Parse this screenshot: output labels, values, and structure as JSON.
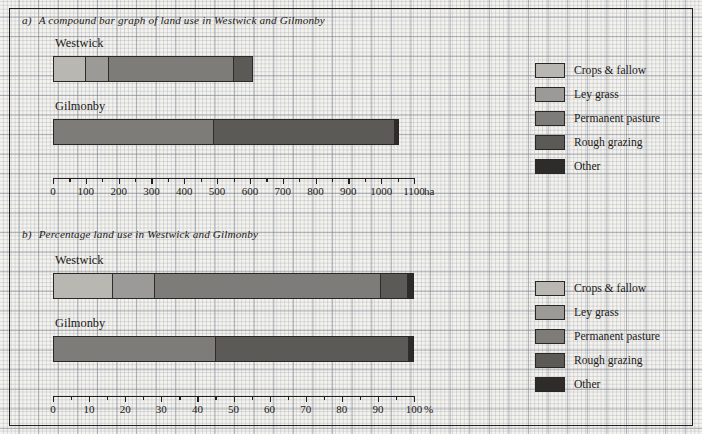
{
  "colors": {
    "crops_fallow": "#b9b7b2",
    "ley_grass": "#9c9a96",
    "permanent_pasture": "#7e7c78",
    "rough_grazing": "#5c5a57",
    "other": "#2e2c2a",
    "ink": "#1b1917",
    "paper": "#f4f3ee"
  },
  "legend": {
    "items": [
      {
        "label": "Crops & fallow",
        "color": "#b9b7b2"
      },
      {
        "label": "Ley grass",
        "color": "#9c9a96"
      },
      {
        "label": "Permanent pasture",
        "color": "#7e7c78"
      },
      {
        "label": "Rough grazing",
        "color": "#5c5a57"
      },
      {
        "label": "Other",
        "color": "#2e2c2a"
      }
    ]
  },
  "panel_a": {
    "marker": "a)",
    "title": "A compound bar graph of land use in Westwick and Gilmonby",
    "axis_unit": "ha",
    "bars": [
      {
        "name": "Westwick"
      },
      {
        "name": "Gilmonby"
      }
    ]
  },
  "panel_b": {
    "marker": "b)",
    "title": "Percentage land use in Westwick and Gilmonby",
    "axis_unit": "%",
    "bars": [
      {
        "name": "Westwick"
      },
      {
        "name": "Gilmonby"
      }
    ]
  },
  "chart_data": [
    {
      "type": "bar",
      "orientation": "horizontal",
      "stacked": true,
      "title": "A compound bar graph of land use in Westwick and Gilmonby",
      "marker": "a)",
      "xlabel": "ha",
      "ylabel": "",
      "xlim": [
        0,
        1100
      ],
      "xticks": [
        0,
        100,
        200,
        300,
        400,
        500,
        600,
        700,
        800,
        900,
        1000,
        1100
      ],
      "xticklabels": [
        "0",
        "100",
        "200",
        "300",
        "400",
        "500",
        "600",
        "700",
        "800",
        "900",
        "1000",
        "1100"
      ],
      "minor_ticks_between": 1,
      "grid": true,
      "legend_position": "right",
      "categories": [
        "Westwick",
        "Gilmonby"
      ],
      "series": [
        {
          "name": "Crops & fallow",
          "color": "#b9b7b2",
          "values": [
            100,
            0
          ]
        },
        {
          "name": "Ley grass",
          "color": "#9c9a96",
          "values": [
            70,
            0
          ]
        },
        {
          "name": "Permanent pasture",
          "color": "#7e7c78",
          "values": [
            385,
            490
          ]
        },
        {
          "name": "Rough grazing",
          "color": "#5c5a57",
          "values": [
            55,
            555
          ]
        },
        {
          "name": "Other",
          "color": "#2e2c2a",
          "values": [
            0,
            10
          ]
        }
      ],
      "totals": [
        610,
        1055
      ]
    },
    {
      "type": "bar",
      "orientation": "horizontal",
      "stacked": true,
      "title": "Percentage land use in Westwick and Gilmonby",
      "marker": "b)",
      "xlabel": "%",
      "ylabel": "",
      "xlim": [
        0,
        100
      ],
      "xticks": [
        0,
        10,
        20,
        30,
        40,
        50,
        60,
        70,
        80,
        90,
        100
      ],
      "xticklabels": [
        "0",
        "10",
        "20",
        "30",
        "40",
        "50",
        "60",
        "70",
        "80",
        "90",
        "100"
      ],
      "minor_ticks_between": 1,
      "grid": true,
      "legend_position": "right",
      "categories": [
        "Westwick",
        "Gilmonby"
      ],
      "series": [
        {
          "name": "Crops & fallow",
          "color": "#b9b7b2",
          "values": [
            16.5,
            0
          ]
        },
        {
          "name": "Ley grass",
          "color": "#9c9a96",
          "values": [
            11.5,
            0
          ]
        },
        {
          "name": "Permanent pasture",
          "color": "#7e7c78",
          "values": [
            63,
            45
          ]
        },
        {
          "name": "Rough grazing",
          "color": "#5c5a57",
          "values": [
            7.5,
            54
          ]
        },
        {
          "name": "Other",
          "color": "#2e2c2a",
          "values": [
            1.5,
            1
          ]
        }
      ],
      "totals": [
        100,
        100
      ]
    }
  ]
}
